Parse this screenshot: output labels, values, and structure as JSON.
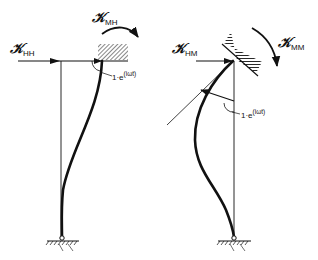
{
  "figure": {
    "left_panel": {
      "force_label": {
        "symbol": "𝒦",
        "subscript": "HH"
      },
      "moment_label": {
        "symbol": "𝒦",
        "subscript": "MH"
      },
      "displacement_label": {
        "prefix": "1·e",
        "exponent": "(iωt)"
      }
    },
    "right_panel": {
      "force_label": {
        "symbol": "𝒦",
        "subscript": "HM"
      },
      "moment_label": {
        "symbol": "𝒦",
        "subscript": "MM"
      },
      "rotation_label": {
        "prefix": "1·e",
        "exponent": "(iωt)"
      }
    },
    "colors": {
      "ink": "#111111",
      "background": "#ffffff"
    }
  }
}
